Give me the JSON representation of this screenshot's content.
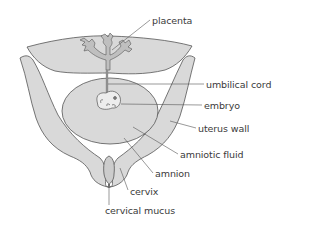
{
  "diagram": {
    "colors": {
      "tissue_fill": "#d9d9d9",
      "outline": "#555555",
      "leader_line": "#555555",
      "text": "#3a3a3a",
      "background": "#ffffff"
    },
    "labels": [
      {
        "id": "placenta",
        "text": "placenta",
        "x": 152,
        "y": 16
      },
      {
        "id": "umbilical-cord",
        "text": "umbilical cord",
        "x": 206,
        "y": 80
      },
      {
        "id": "embryo",
        "text": "embryo",
        "x": 204,
        "y": 101
      },
      {
        "id": "uterus-wall",
        "text": "uterus wall",
        "x": 198,
        "y": 124
      },
      {
        "id": "amniotic-fluid",
        "text": "amniotic fluid",
        "x": 180,
        "y": 150
      },
      {
        "id": "amnion",
        "text": "amnion",
        "x": 155,
        "y": 169
      },
      {
        "id": "cervix",
        "text": "cervix",
        "x": 130,
        "y": 187
      },
      {
        "id": "cervical-mucus",
        "text": "cervical mucus",
        "x": 105,
        "y": 206
      }
    ]
  }
}
